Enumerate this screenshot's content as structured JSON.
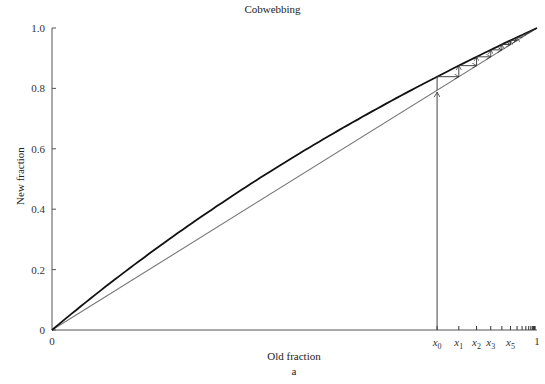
{
  "chart_data": {
    "type": "line",
    "title": "Cobwebbing",
    "xlabel": "Old fraction",
    "ylabel": "New fraction",
    "sublabel": "a",
    "xlim": [
      0,
      1
    ],
    "ylim": [
      0,
      1
    ],
    "y_ticks": [
      "0",
      "0.2",
      "0.4",
      "0.6",
      "0.8",
      "1.0"
    ],
    "x_ticks": [
      "0",
      "1"
    ],
    "grid": false,
    "series": [
      {
        "name": "recurrence curve",
        "formula": "x(1+s)/(1+s x)",
        "s": 0.35,
        "color": "#111111"
      },
      {
        "name": "diagonal y=x",
        "color": "#777777"
      }
    ],
    "cobweb": {
      "x0": 0.794,
      "iterates_labeled": [
        "x0",
        "x1",
        "x2",
        "x3",
        "x5"
      ],
      "iterate_positions": [
        0.794,
        0.838,
        0.873,
        0.9,
        0.922,
        0.94,
        0.955,
        0.966,
        0.975,
        0.982,
        0.988,
        0.992,
        0.995,
        0.997
      ]
    },
    "annotations": [
      "x0",
      "x1",
      "x2",
      "x3",
      "x5"
    ]
  }
}
